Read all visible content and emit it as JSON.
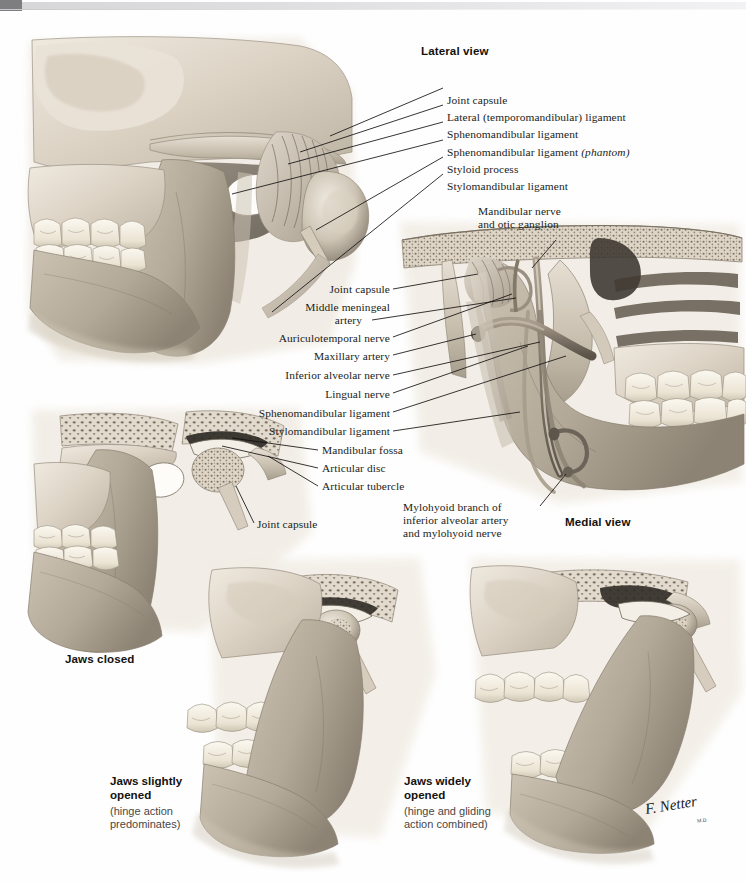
{
  "topbar": {
    "present": true,
    "dark_block_color": "#7e7e80",
    "light_bar_color": "#dedee0"
  },
  "plate": {
    "medium": "grayscale anatomical illustration",
    "signature": {
      "name": "F. Netter",
      "sub": "M.D."
    }
  },
  "headings": {
    "lateral_view": "Lateral view",
    "medial_view": "Medial view",
    "jaws_closed": "Jaws closed"
  },
  "lateral_labels": [
    {
      "text": "Joint capsule"
    },
    {
      "text": "Lateral (temporomandibular) ligament"
    },
    {
      "text": "Sphenomandibular ligament"
    },
    {
      "text": "Sphenomandibular ligament ",
      "italic": "(phantom)"
    },
    {
      "text": "Styloid process"
    },
    {
      "text": "Stylomandibular ligament"
    }
  ],
  "mandibular_nerve_label": {
    "line1": "Mandibular nerve",
    "line2": "and otic ganglion"
  },
  "medial_labels": [
    {
      "text": "Joint capsule"
    },
    {
      "text": "Middle meningeal"
    },
    {
      "text": "artery"
    },
    {
      "text": "Auriculotemporal nerve"
    },
    {
      "text": "Maxillary artery"
    },
    {
      "text": "Inferior alveolar nerve"
    },
    {
      "text": "Lingual nerve"
    },
    {
      "text": "Sphenomandibular ligament"
    },
    {
      "text": "Stylomandibular ligament"
    },
    {
      "text": "Mandibular fossa"
    },
    {
      "text": "Articular disc"
    },
    {
      "text": "Articular tubercle"
    }
  ],
  "joint_capsule_lower": "Joint capsule",
  "mylohyoid_label": {
    "line1": "Mylohyoid branch of",
    "line2": "inferior alveolar artery",
    "line3": "and mylohyoid nerve"
  },
  "bottom_captions": [
    {
      "title_line1": "Jaws slightly",
      "title_line2": "opened",
      "sub_line1": "(hinge action",
      "sub_line2": "predominates)"
    },
    {
      "title_line1": "Jaws widely",
      "title_line2": "opened",
      "sub_line1": "(hinge and gliding",
      "sub_line2": "action combined)"
    }
  ],
  "colors": {
    "bone_light": "#e8e1d6",
    "bone_mid": "#c9bfb0",
    "bone_dark": "#938a7c",
    "shadow": "#6d665c",
    "tooth": "#f4f0e6",
    "text": "#201d1a",
    "caption_gray": "#4a4744"
  }
}
